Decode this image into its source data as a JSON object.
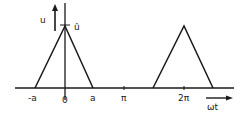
{
  "diagram": {
    "type": "triangular-pulse-waveform",
    "y_axis_label": "u",
    "peak_label": "û",
    "x_axis_label": "ωt",
    "tick_labels": {
      "neg_a": "-a",
      "zero": "0",
      "a": "a",
      "pi": "π",
      "two_pi": "2π"
    },
    "pulses": [
      {
        "center": "0",
        "half_width": "a",
        "peak": "û"
      },
      {
        "center": "2π",
        "half_width": "a",
        "peak": "û"
      }
    ],
    "colors": {
      "line": "#1a1a1a",
      "background": "#ffffff"
    }
  }
}
